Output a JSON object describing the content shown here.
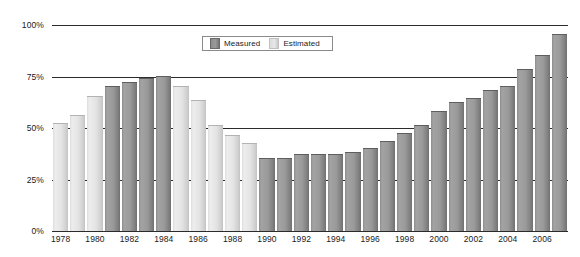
{
  "chart_data": {
    "type": "bar",
    "title": "",
    "xlabel": "",
    "ylabel": "",
    "ylim": [
      0,
      100
    ],
    "ytick_labels": [
      "0%",
      "25%",
      "50%",
      "75%",
      "100%"
    ],
    "ytick_values": [
      0,
      25,
      50,
      75,
      100
    ],
    "grid": true,
    "legend_position": "top-center",
    "legend": [
      {
        "name": "Measured",
        "color": "#9a9a9a"
      },
      {
        "name": "Estimated",
        "color": "#e0e0e0"
      }
    ],
    "categories": [
      "1978",
      "1979",
      "1980",
      "1981",
      "1982",
      "1983",
      "1984",
      "1985",
      "1986",
      "1987",
      "1988",
      "1989",
      "1990",
      "1991",
      "1992",
      "1993",
      "1994",
      "1995",
      "1996",
      "1997",
      "1998",
      "1999",
      "2000",
      "2001",
      "2002",
      "2003",
      "2004",
      "2005",
      "2006",
      "2007"
    ],
    "xtick_labels": [
      "1978",
      "1980",
      "1982",
      "1984",
      "1986",
      "1988",
      "1990",
      "1992",
      "1994",
      "1996",
      "1998",
      "2000",
      "2002",
      "2004",
      "2006"
    ],
    "values": [
      52,
      56,
      65,
      70,
      72,
      74,
      75,
      70,
      63,
      51,
      46,
      42,
      35,
      35,
      37,
      37,
      37,
      38,
      40,
      43,
      47,
      51,
      58,
      62,
      64,
      68,
      70,
      78,
      85,
      95
    ],
    "series_type": [
      "estimated",
      "estimated",
      "estimated",
      "measured",
      "measured",
      "measured",
      "measured",
      "estimated",
      "estimated",
      "estimated",
      "estimated",
      "estimated",
      "measured",
      "measured",
      "measured",
      "measured",
      "measured",
      "measured",
      "measured",
      "measured",
      "measured",
      "measured",
      "measured",
      "measured",
      "measured",
      "measured",
      "measured",
      "measured",
      "measured",
      "measured"
    ]
  },
  "colors": {
    "measured": "#9a9a9a",
    "estimated": "#e2e2e2",
    "axis": "#2b2b2b",
    "text": "#1a1a1a"
  }
}
